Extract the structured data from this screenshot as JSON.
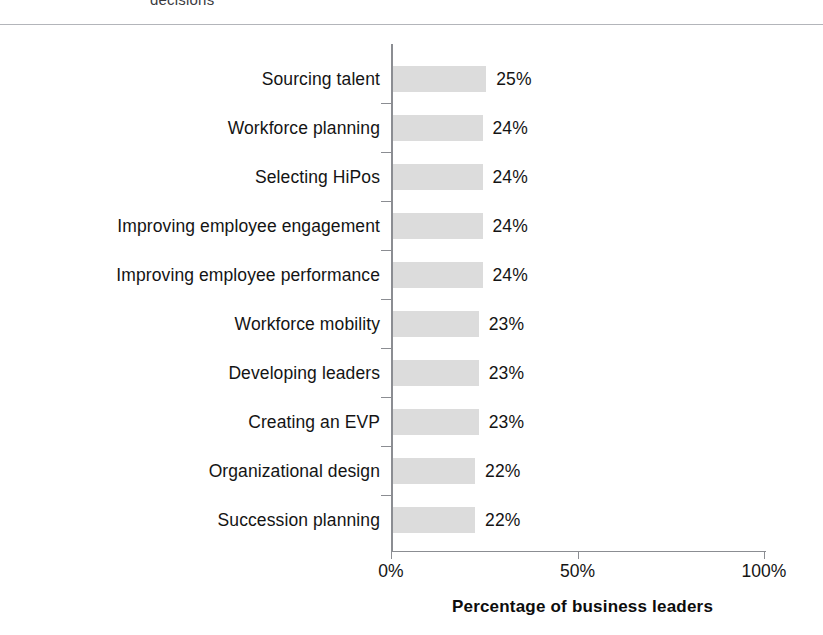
{
  "document": {
    "clipped_caption": "decisions"
  },
  "chart_data": {
    "type": "bar",
    "orientation": "horizontal",
    "title": "",
    "xlabel": "Percentage of business leaders",
    "ylabel": "",
    "xlim": [
      0,
      100
    ],
    "grid": false,
    "legend": false,
    "bar_color": "#dcdcdc",
    "axis_color": "#8b8d92",
    "categories": [
      "Sourcing talent",
      "Workforce planning",
      "Selecting HiPos",
      "Improving employee engagement",
      "Improving employee performance",
      "Workforce mobility",
      "Developing leaders",
      "Creating an EVP",
      "Organizational design",
      "Succession planning"
    ],
    "values": [
      25,
      24,
      24,
      24,
      24,
      23,
      23,
      23,
      22,
      22
    ],
    "value_labels": [
      "25%",
      "24%",
      "24%",
      "24%",
      "24%",
      "23%",
      "23%",
      "23%",
      "22%",
      "22%"
    ],
    "x_ticks": [
      0,
      50,
      100
    ],
    "x_tick_labels": [
      "0%",
      "50%",
      "100%"
    ]
  }
}
